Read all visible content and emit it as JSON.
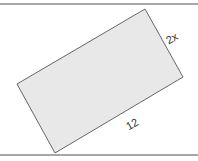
{
  "figure": {
    "shape": "rectangle",
    "fill_color": "#e8e8e8",
    "stroke_color": "#666666",
    "rule_color": "#8a8a8a",
    "labels": {
      "short_side": "2x",
      "long_side": "12"
    }
  }
}
